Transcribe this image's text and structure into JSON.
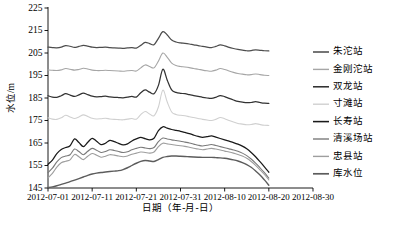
{
  "chart_data": {
    "type": "line",
    "title": "",
    "xlabel": "日期（年-月-日）",
    "ylabel": "水位/m",
    "ylim": [
      145,
      225
    ],
    "ytick_labels": [
      "145",
      "155",
      "165",
      "175",
      "185",
      "195",
      "205",
      "215",
      "225"
    ],
    "ytick_values": [
      145,
      155,
      165,
      175,
      185,
      195,
      205,
      215,
      225
    ],
    "xtick_labels": [
      "2012-07-01",
      "2012-07-11",
      "2012-07-21",
      "2012-07-31",
      "2012-08-10",
      "2012-08-20",
      "2012-08-30"
    ],
    "xlim": [
      "2012-07-01",
      "2012-08-30"
    ],
    "x_domain_days": [
      0,
      60
    ],
    "x_data_end_day": 50,
    "grid": false,
    "legend_position": "right",
    "series": [
      {
        "name": "朱沱站",
        "color": "#4d4d4d",
        "width": 1.25,
        "x": [
          0,
          1,
          2,
          3,
          4,
          5,
          6,
          7,
          8,
          9,
          10,
          11,
          12,
          13,
          14,
          15,
          16,
          17,
          18,
          19,
          20,
          21,
          22,
          23,
          24,
          25,
          26,
          27,
          28,
          29,
          30,
          31,
          32,
          33,
          34,
          35,
          36,
          37,
          38,
          39,
          40,
          41,
          42,
          43,
          44,
          45,
          46,
          47,
          48,
          49,
          50
        ],
        "values": [
          207.6,
          207.4,
          207.3,
          207.6,
          208.3,
          208.0,
          207.5,
          207.9,
          208.4,
          208.1,
          207.6,
          207.4,
          207.5,
          207.6,
          207.4,
          207.3,
          207.2,
          207.1,
          207.3,
          207.4,
          207.2,
          208.4,
          209.7,
          209.2,
          208.7,
          211.5,
          214.5,
          213.0,
          210.8,
          209.9,
          209.5,
          209.3,
          209.0,
          208.6,
          208.3,
          207.9,
          207.6,
          207.4,
          207.9,
          208.6,
          208.2,
          207.5,
          207.0,
          206.6,
          206.3,
          206.0,
          206.1,
          206.4,
          206.2,
          206.0,
          205.9
        ]
      },
      {
        "name": "金刚沱站",
        "color": "#a6a6a6",
        "width": 1.1,
        "x": [
          0,
          1,
          2,
          3,
          4,
          5,
          6,
          7,
          8,
          9,
          10,
          11,
          12,
          13,
          14,
          15,
          16,
          17,
          18,
          19,
          20,
          21,
          22,
          23,
          24,
          25,
          26,
          27,
          28,
          29,
          30,
          31,
          32,
          33,
          34,
          35,
          36,
          37,
          38,
          39,
          40,
          41,
          42,
          43,
          44,
          45,
          46,
          47,
          48,
          49,
          50
        ],
        "values": [
          197.5,
          197.3,
          197.2,
          197.5,
          198.1,
          197.8,
          197.4,
          197.7,
          198.2,
          197.9,
          197.4,
          197.2,
          197.2,
          197.3,
          197.2,
          197.1,
          197.0,
          196.9,
          197.1,
          197.2,
          197.0,
          198.4,
          199.7,
          199.0,
          198.4,
          201.4,
          205.0,
          203.1,
          200.5,
          199.4,
          199.0,
          198.8,
          198.5,
          198.1,
          197.8,
          197.4,
          197.1,
          196.9,
          197.4,
          198.1,
          197.7,
          197.0,
          196.4,
          195.9,
          195.6,
          195.3,
          195.4,
          195.7,
          195.4,
          195.1,
          195.0
        ]
      },
      {
        "name": "双龙站",
        "color": "#333333",
        "width": 1.25,
        "x": [
          0,
          1,
          2,
          3,
          4,
          5,
          6,
          7,
          8,
          9,
          10,
          11,
          12,
          13,
          14,
          15,
          16,
          17,
          18,
          19,
          20,
          21,
          22,
          23,
          24,
          25,
          26,
          27,
          28,
          29,
          30,
          31,
          32,
          33,
          34,
          35,
          36,
          37,
          38,
          39,
          40,
          41,
          42,
          43,
          44,
          45,
          46,
          47,
          48,
          49,
          50
        ],
        "values": [
          186.0,
          185.4,
          185.3,
          186.0,
          186.9,
          186.3,
          185.7,
          186.4,
          187.2,
          186.5,
          185.8,
          185.5,
          185.6,
          185.8,
          185.5,
          185.3,
          185.2,
          185.1,
          185.4,
          185.7,
          185.4,
          187.3,
          188.6,
          187.6,
          186.9,
          190.6,
          197.8,
          192.9,
          188.6,
          187.5,
          187.1,
          186.9,
          186.5,
          186.1,
          185.7,
          185.3,
          185.0,
          184.8,
          185.3,
          186.1,
          185.6,
          184.8,
          184.1,
          183.5,
          183.2,
          182.9,
          183.0,
          183.4,
          183.0,
          182.7,
          182.6
        ]
      },
      {
        "name": "寸滩站",
        "color": "#d0d0d0",
        "width": 1.1,
        "x": [
          0,
          1,
          2,
          3,
          4,
          5,
          6,
          7,
          8,
          9,
          10,
          11,
          12,
          13,
          14,
          15,
          16,
          17,
          18,
          19,
          20,
          21,
          22,
          23,
          24,
          25,
          26,
          27,
          28,
          29,
          30,
          31,
          32,
          33,
          34,
          35,
          36,
          37,
          38,
          39,
          40,
          41,
          42,
          43,
          44,
          45,
          46,
          47,
          48,
          49,
          50
        ],
        "values": [
          176.2,
          175.6,
          175.5,
          176.2,
          177.3,
          176.6,
          175.9,
          176.6,
          177.5,
          176.8,
          176.0,
          175.7,
          175.8,
          176.0,
          175.7,
          175.5,
          175.4,
          175.3,
          175.6,
          175.9,
          175.6,
          177.6,
          179.0,
          177.9,
          177.1,
          181.0,
          188.5,
          183.2,
          178.8,
          177.7,
          177.3,
          177.1,
          176.7,
          176.3,
          175.9,
          175.5,
          175.2,
          175.0,
          175.5,
          176.3,
          175.8,
          175.0,
          174.3,
          173.7,
          173.4,
          173.1,
          173.2,
          173.6,
          173.2,
          172.9,
          172.8
        ]
      },
      {
        "name": "长寿站",
        "color": "#1a1a1a",
        "width": 1.25,
        "x": [
          0,
          1,
          2,
          3,
          4,
          5,
          6,
          7,
          8,
          9,
          10,
          11,
          12,
          13,
          14,
          15,
          16,
          17,
          18,
          19,
          20,
          21,
          22,
          23,
          24,
          25,
          26,
          27,
          28,
          29,
          30,
          31,
          32,
          33,
          34,
          35,
          36,
          37,
          38,
          39,
          40,
          41,
          42,
          43,
          44,
          45,
          46,
          47,
          48,
          49,
          50
        ],
        "values": [
          155.5,
          157.4,
          160.3,
          162.1,
          163.0,
          163.8,
          166.8,
          165.2,
          163.4,
          165.3,
          167.1,
          165.8,
          164.3,
          164.9,
          166.2,
          165.6,
          164.8,
          164.2,
          164.6,
          165.9,
          166.8,
          167.5,
          166.9,
          166.4,
          167.1,
          170.5,
          172.2,
          171.6,
          171.0,
          170.6,
          170.2,
          169.7,
          169.2,
          168.5,
          167.9,
          167.5,
          167.8,
          168.2,
          167.6,
          167.0,
          166.4,
          165.8,
          165.2,
          164.5,
          163.6,
          162.4,
          160.8,
          158.9,
          156.7,
          154.4,
          152.0
        ]
      },
      {
        "name": "清溪场站",
        "color": "#7a7a7a",
        "width": 1.1,
        "x": [
          0,
          1,
          2,
          3,
          4,
          5,
          6,
          7,
          8,
          9,
          10,
          11,
          12,
          13,
          14,
          15,
          16,
          17,
          18,
          19,
          20,
          21,
          22,
          23,
          24,
          25,
          26,
          27,
          28,
          29,
          30,
          31,
          32,
          33,
          34,
          35,
          36,
          37,
          38,
          39,
          40,
          41,
          42,
          43,
          44,
          45,
          46,
          47,
          48,
          49,
          50
        ],
        "values": [
          151.8,
          153.8,
          156.6,
          158.5,
          159.2,
          159.8,
          162.3,
          161.2,
          159.8,
          161.3,
          162.6,
          161.8,
          160.8,
          161.2,
          162.0,
          161.7,
          161.2,
          160.8,
          161.1,
          162.0,
          162.6,
          163.1,
          162.8,
          162.5,
          163.0,
          165.6,
          167.2,
          166.8,
          166.4,
          166.1,
          165.8,
          165.4,
          165.0,
          164.5,
          164.0,
          163.7,
          164.0,
          164.3,
          163.9,
          163.4,
          162.9,
          162.4,
          161.9,
          161.3,
          160.5,
          159.4,
          157.9,
          156.1,
          154.0,
          151.8,
          149.4
        ]
      },
      {
        "name": "忠县站",
        "color": "#9e9e9e",
        "width": 1.1,
        "x": [
          0,
          1,
          2,
          3,
          4,
          5,
          6,
          7,
          8,
          9,
          10,
          11,
          12,
          13,
          14,
          15,
          16,
          17,
          18,
          19,
          20,
          21,
          22,
          23,
          24,
          25,
          26,
          27,
          28,
          29,
          30,
          31,
          32,
          33,
          34,
          35,
          36,
          37,
          38,
          39,
          40,
          41,
          42,
          43,
          44,
          45,
          46,
          47,
          48,
          49,
          50
        ],
        "values": [
          149.5,
          151.5,
          154.3,
          156.2,
          156.9,
          157.5,
          159.9,
          158.9,
          157.6,
          159.1,
          160.3,
          159.6,
          158.7,
          159.1,
          159.8,
          159.6,
          159.2,
          158.9,
          159.2,
          160.0,
          160.5,
          161.0,
          160.8,
          160.5,
          161.0,
          163.4,
          164.9,
          164.6,
          164.3,
          164.0,
          163.8,
          163.5,
          163.1,
          162.7,
          162.3,
          162.0,
          162.3,
          162.6,
          162.3,
          161.9,
          161.4,
          161.0,
          160.5,
          159.9,
          159.2,
          158.2,
          156.8,
          155.1,
          153.1,
          151.0,
          148.6
        ]
      },
      {
        "name": "库水位",
        "color": "#5c5c5c",
        "width": 1.4,
        "x": [
          0,
          1,
          2,
          3,
          4,
          5,
          6,
          7,
          8,
          9,
          10,
          11,
          12,
          13,
          14,
          15,
          16,
          17,
          18,
          19,
          20,
          21,
          22,
          23,
          24,
          25,
          26,
          27,
          28,
          29,
          30,
          31,
          32,
          33,
          34,
          35,
          36,
          37,
          38,
          39,
          40,
          41,
          42,
          43,
          44,
          45,
          46,
          47,
          48,
          49,
          50
        ],
        "values": [
          145.2,
          145.5,
          146.0,
          146.6,
          147.2,
          147.8,
          148.5,
          149.2,
          149.9,
          150.6,
          151.2,
          151.6,
          151.9,
          152.1,
          152.3,
          152.5,
          152.7,
          153.2,
          154.0,
          155.0,
          156.0,
          156.8,
          157.2,
          157.0,
          156.8,
          157.6,
          158.6,
          159.0,
          159.2,
          159.2,
          159.1,
          159.0,
          158.9,
          158.8,
          158.7,
          158.6,
          158.6,
          158.6,
          158.5,
          158.4,
          158.2,
          157.9,
          157.5,
          157.0,
          156.3,
          155.4,
          154.2,
          152.6,
          150.8,
          148.6,
          146.2
        ]
      }
    ]
  },
  "legend": {
    "items": [
      {
        "label": "朱沱站"
      },
      {
        "label": "金刚沱站"
      },
      {
        "label": "双龙站"
      },
      {
        "label": "寸滩站"
      },
      {
        "label": "长寿站"
      },
      {
        "label": "清溪场站"
      },
      {
        "label": "忠县站"
      },
      {
        "label": "库水位"
      }
    ]
  }
}
